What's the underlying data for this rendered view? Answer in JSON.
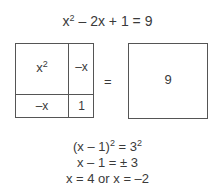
{
  "equation": {
    "base": "x",
    "exponent": "2",
    "rest": " – 2x + 1 = 9"
  },
  "left_square": {
    "top_left": {
      "base": "x",
      "exponent": "2"
    },
    "top_right": "–x",
    "bottom_left": "–x",
    "bottom_right": "1"
  },
  "equals_sign": "=",
  "right_square": {
    "value": "9"
  },
  "steps": [
    {
      "prefix": "(x – 1)",
      "exp1": "2",
      "middle": " = 3",
      "exp2": "2"
    },
    {
      "text": "x – 1 = ± 3"
    },
    {
      "text": "x = 4 or x = –2"
    }
  ],
  "colors": {
    "text": "#3a3a3a",
    "lines": "#555555",
    "background": "#ffffff"
  }
}
